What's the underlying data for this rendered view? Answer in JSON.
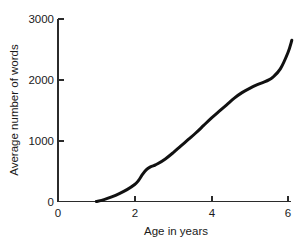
{
  "chart_data": {
    "type": "line",
    "title": "",
    "xlabel": "Age in years",
    "ylabel": "Average number of words",
    "xlim": [
      0,
      6.3
    ],
    "ylim": [
      0,
      3000
    ],
    "xticks": [
      0,
      2,
      4,
      6
    ],
    "xtick_labels": [
      "0",
      "2",
      "4",
      "6"
    ],
    "yticks": [
      0,
      1000,
      2000,
      3000
    ],
    "ytick_labels": [
      "0",
      "1000",
      "2000",
      "3000"
    ],
    "grid": false,
    "legend": null,
    "series": [
      {
        "name": "Average number of words",
        "color": "#111111",
        "x": [
          1.0,
          1.2,
          1.4,
          1.6,
          1.8,
          2.0,
          2.1,
          2.2,
          2.3,
          2.4,
          2.5,
          2.6,
          2.8,
          3.0,
          3.2,
          3.4,
          3.6,
          3.8,
          4.0,
          4.2,
          4.4,
          4.6,
          4.8,
          5.0,
          5.2,
          5.4,
          5.5,
          5.6,
          5.8,
          6.0,
          6.1
        ],
        "y": [
          0,
          30,
          75,
          130,
          195,
          280,
          345,
          440,
          520,
          565,
          590,
          620,
          700,
          800,
          910,
          1020,
          1130,
          1250,
          1370,
          1480,
          1590,
          1700,
          1790,
          1860,
          1920,
          1970,
          2000,
          2040,
          2180,
          2450,
          2650
        ]
      }
    ]
  },
  "axis_titles": {
    "x": "Age in years",
    "y": "Average number of words"
  }
}
